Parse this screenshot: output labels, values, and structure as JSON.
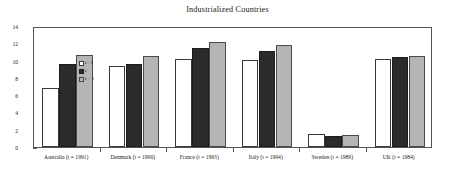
{
  "chart_data": {
    "type": "bar",
    "title": "Industrialized Countries",
    "xlabel": "",
    "ylabel": "",
    "ylim": [
      0,
      14
    ],
    "grid": false,
    "legend_position": "top-left-inside",
    "y_ticks": [
      0,
      2,
      4,
      6,
      8,
      10,
      12,
      14
    ],
    "y_tick_labels": [
      "0",
      "2",
      "4",
      "6",
      "8",
      "10",
      "12",
      "14"
    ],
    "y_minor_ticks": [
      1,
      3,
      5,
      7,
      9,
      11,
      13
    ],
    "categories": [
      "Australia (t = 1991)",
      "Denmark (t = 1990)",
      "France (t = 1993)",
      "Italy (t = 1994)",
      "Sweden (t = 1989)",
      "UK (t = 1984)"
    ],
    "series": [
      {
        "name": "t - 1",
        "color": "#ffffff",
        "values": [
          6.8,
          9.4,
          10.2,
          10.05,
          1.5,
          10.2
        ]
      },
      {
        "name": "t",
        "color": "#2b2b2b",
        "values": [
          9.6,
          9.65,
          11.5,
          11.1,
          1.3,
          10.4
        ]
      },
      {
        "name": "t + 1",
        "color": "#b5b5b5",
        "values": [
          10.7,
          10.5,
          12.1,
          11.85,
          1.35,
          10.55
        ]
      }
    ]
  },
  "legend": {
    "items": [
      {
        "label": "t - 1"
      },
      {
        "label": "t"
      },
      {
        "label": "t + 1"
      }
    ]
  }
}
